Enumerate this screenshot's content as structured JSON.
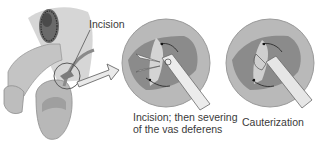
{
  "figure": {
    "labels": {
      "incision": "Incision",
      "step2_line1": "Incision; then severing",
      "step2_line2": "of the vas deferens",
      "step3": "Cauterization"
    },
    "panels": [
      {
        "id": "anatomy-overview",
        "description": "Side view of male genital anatomy with incision site circled"
      },
      {
        "id": "severing-detail",
        "description": "Magnified circle: scissors cutting the vas deferens"
      },
      {
        "id": "cauterization-detail",
        "description": "Magnified circle: cautery instrument sealing vas deferens ends"
      }
    ],
    "colors": {
      "skin": "#c9c9c9",
      "skin_shadow": "#a9a9a9",
      "circle_fill": "#b5b5b5",
      "tissue": "#8a8a8a",
      "tissue_light": "#d8d8d8",
      "instrument": "#e8e8e8",
      "outline": "#555555",
      "text": "#3a3a3a"
    }
  }
}
